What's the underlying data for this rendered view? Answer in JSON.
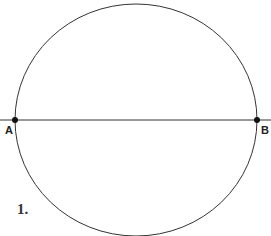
{
  "diagram": {
    "points": [
      {
        "label": "A",
        "x": 15,
        "y": 120
      },
      {
        "label": "B",
        "x": 257,
        "y": 120
      }
    ],
    "figure_label": "1.",
    "stroke_color": "#333333"
  }
}
